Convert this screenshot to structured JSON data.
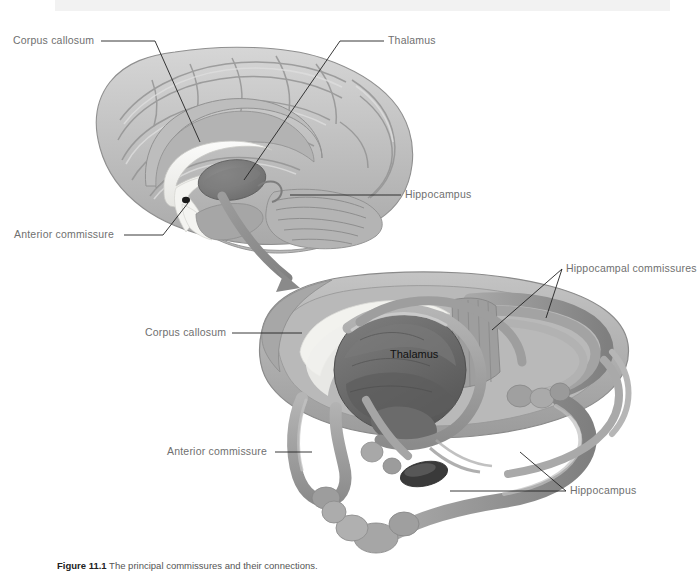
{
  "figure": {
    "top_band_color": "#f2f2f2",
    "background": "#ffffff"
  },
  "palette": {
    "cortex_light": "#c9c9c9",
    "cortex_mid": "#b0b0b0",
    "cortex_dark": "#8e8e8e",
    "outline": "#8a8a8a",
    "white_matter": "#f1f1f1",
    "corpus_callosum_fill": "#f0f0ee",
    "thalamus_fill": "#6f6f6f",
    "thalamus_dark": "#5a5a5a",
    "tract_gray": "#9a9a9a",
    "arrow_gray": "#8f8f8f",
    "label_text": "#6f6f6f",
    "label_text_dark": "#111111",
    "leader_line": "#222222"
  },
  "upper_panel": {
    "name": "midsagittal-brain-view",
    "labels": [
      {
        "id": "corpus-callosum-upper",
        "text": "Corpus callosum",
        "x": 13,
        "y": 44,
        "anchor": "start"
      },
      {
        "id": "thalamus-upper",
        "text": "Thalamus",
        "x": 388,
        "y": 44,
        "anchor": "start"
      },
      {
        "id": "hippocampus-upper",
        "text": "Hippocampus",
        "x": 405,
        "y": 198,
        "anchor": "start"
      },
      {
        "id": "anterior-commissure-upper",
        "text": "Anterior commissure",
        "x": 14,
        "y": 238,
        "anchor": "start"
      }
    ]
  },
  "lower_panel": {
    "name": "commissural-fiber-3d-view",
    "labels": [
      {
        "id": "hippocampal-commissures",
        "text": "Hippocampal commissures",
        "x": 566,
        "y": 272,
        "anchor": "start"
      },
      {
        "id": "corpus-callosum-lower",
        "text": "Corpus callosum",
        "x": 145,
        "y": 336,
        "anchor": "start"
      },
      {
        "id": "thalamus-lower",
        "text": "Thalamus",
        "x": 390,
        "y": 358,
        "anchor": "start",
        "style": "dark"
      },
      {
        "id": "anterior-commissure-lower",
        "text": "Anterior commissure",
        "x": 167,
        "y": 455,
        "anchor": "start"
      },
      {
        "id": "hippocampus-lower",
        "text": "Hippocampus",
        "x": 570,
        "y": 494,
        "anchor": "start"
      }
    ]
  },
  "caption": {
    "figure_number": "Figure 11.1",
    "text": "The principal commissures and their connections."
  }
}
